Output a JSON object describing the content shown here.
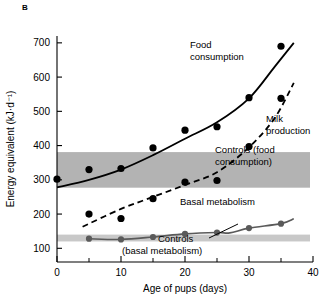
{
  "panel": {
    "letter": "B"
  },
  "chart_data": {
    "type": "line",
    "title": "",
    "xlabel": "Age of pups (days)",
    "ylabel": "Energy equivalent (kJ·d⁻¹)",
    "xlim": [
      0,
      40
    ],
    "ylim": [
      60,
      720
    ],
    "xticks": [
      0,
      10,
      20,
      30,
      40
    ],
    "xtick_labels": [
      "0",
      "10",
      "20",
      "30",
      "40"
    ],
    "xticks_minor": [
      5,
      15,
      25,
      35
    ],
    "yticks": [
      100,
      200,
      300,
      400,
      500,
      600,
      700
    ],
    "ytick_labels": [
      "100",
      "200",
      "300",
      "400",
      "500",
      "600",
      "700"
    ],
    "grid": false,
    "legend": "inline-annotations",
    "series": [
      {
        "name": "Food consumption",
        "style": "solid",
        "color": "#000000",
        "marker": "filled-circle",
        "marker_color": "#000000",
        "x": [
          0,
          5,
          10,
          15,
          20,
          25,
          30,
          35
        ],
        "values": [
          302,
          330,
          333,
          393,
          445,
          455,
          540,
          690
        ],
        "fit_x": [
          0,
          5,
          10,
          15,
          20,
          25,
          30,
          34,
          37
        ],
        "fit_y": [
          278,
          300,
          330,
          372,
          420,
          468,
          538,
          630,
          700
        ]
      },
      {
        "name": "Milk production",
        "style": "dashed",
        "color": "#000000",
        "marker": "filled-circle",
        "marker_color": "#000000",
        "x": [
          5,
          10,
          15,
          20,
          25,
          30,
          35
        ],
        "values": [
          200,
          187,
          245,
          293,
          298,
          397,
          538
        ],
        "fit_x": [
          4,
          10,
          15,
          20,
          25,
          30,
          34,
          37
        ],
        "fit_y": [
          163,
          215,
          250,
          285,
          322,
          395,
          480,
          583
        ]
      },
      {
        "name": "Basal metabolism",
        "style": "solid",
        "color": "#5a5a5a",
        "marker": "filled-circle",
        "marker_color": "#5a5a5a",
        "x": [
          5,
          10,
          15,
          20,
          25,
          30,
          35
        ],
        "values": [
          128,
          126,
          133,
          142,
          146,
          159,
          172
        ],
        "fit_x": [
          5,
          10,
          15,
          20,
          25,
          27,
          30,
          35,
          37
        ],
        "fit_y": [
          128,
          126,
          133,
          142,
          146,
          145,
          159,
          172,
          186
        ]
      }
    ],
    "bands": [
      {
        "name": "Controls (food consumption)",
        "label": "Controls (food\nconsumption)",
        "label_line1": "Controls (food",
        "label_line2": "consumption)",
        "y_low": 277,
        "y_high": 381,
        "color": "#b3b3b3"
      },
      {
        "name": "Controls (basal metabolism)",
        "label_line1": "Controls",
        "label_line2": "(basal metabolism)",
        "y_low": 120,
        "y_high": 140,
        "color": "#c8c8c8"
      }
    ],
    "annotations": [
      {
        "name": "food-consumption-label",
        "line1": "Food",
        "line2": "consumption"
      },
      {
        "name": "milk-production-label",
        "line1": "Milk",
        "line2": "production"
      },
      {
        "name": "basal-metabolism-label",
        "line1": "Basal metabolism",
        "line2": ""
      }
    ]
  }
}
